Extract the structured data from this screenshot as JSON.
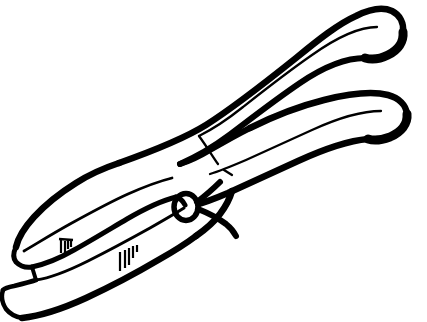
{
  "image": {
    "title": "Pliers",
    "subject": "pliers-hand-tool",
    "style": "black-and-white line art clip art",
    "orientation": "jaws at lower-left, handles extending to upper-right",
    "width": 427,
    "height": 322,
    "background_color": "#ffffff",
    "stroke_color": "#000000",
    "fill_color": "#ffffff",
    "alt_text": "Line drawing of a pair of pliers with the gripping jaws at the lower left and two long handles sweeping up to the right."
  },
  "parts": [
    {
      "id": "upper-handle",
      "label": "Upper handle",
      "description": "Long tapered handle sweeping from the pivot up to the top-right, ending in a rounded tip with a thick filled corner."
    },
    {
      "id": "lower-handle",
      "label": "Lower handle",
      "description": "Second handle below the first, also sweeping to the right and ending in a rounded tip."
    },
    {
      "id": "pivot-rivet",
      "label": "Pivot rivet",
      "description": "Small ellipse at the joint where the two arms cross."
    },
    {
      "id": "upper-jaw",
      "label": "Upper jaw",
      "description": "Flat angled gripping face at the lower-left."
    },
    {
      "id": "lower-jaw",
      "label": "Lower jaw",
      "description": "Second flat gripping face directly beneath the upper jaw, separated by a narrow gap."
    },
    {
      "id": "jaw-serrations",
      "label": "Jaw serrations",
      "description": "Two small clusters of short vertical hatch marks indicating gripping teeth."
    },
    {
      "id": "handle-crotch",
      "label": "Handle crotch",
      "description": "V-shaped fork where the two handles separate."
    }
  ],
  "colors": {
    "stroke": "#000000",
    "background": "#ffffff"
  }
}
